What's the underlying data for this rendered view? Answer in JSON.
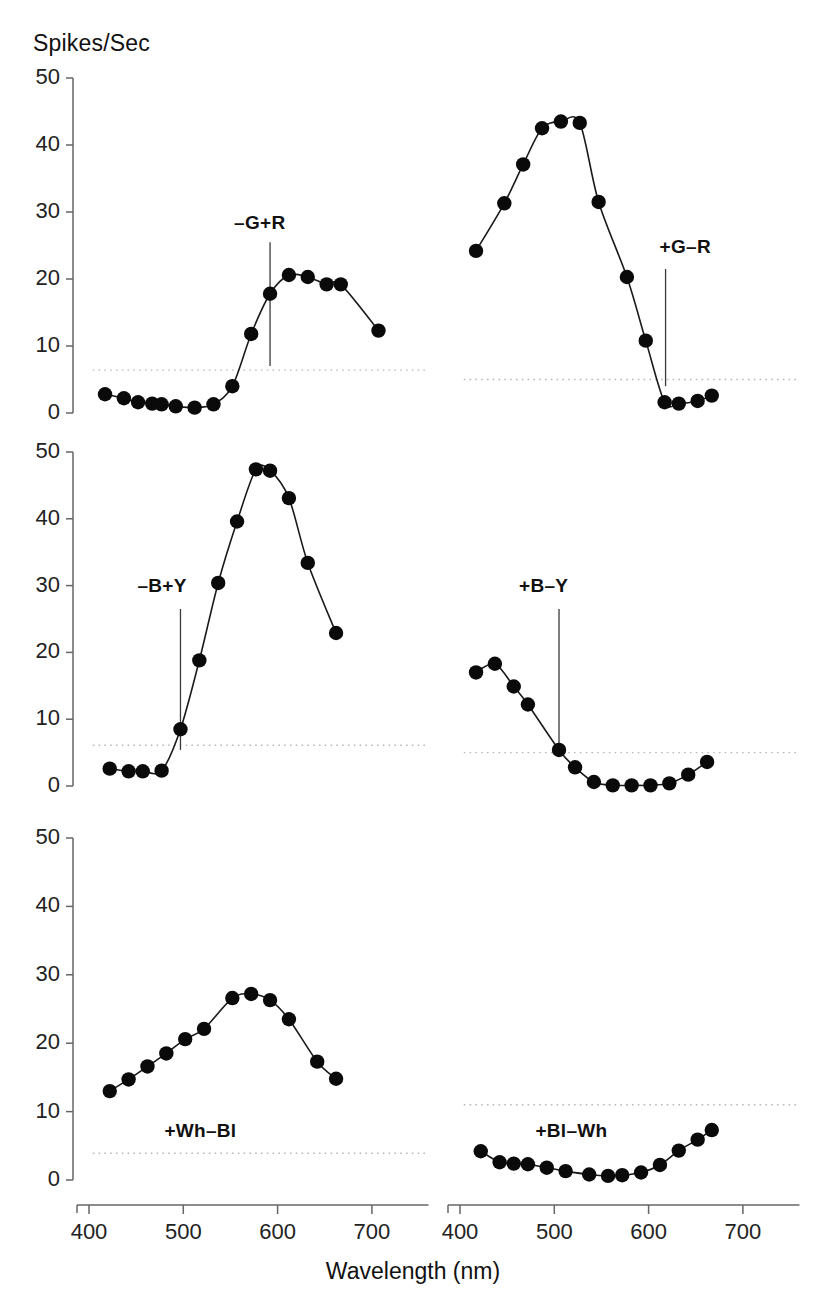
{
  "figure": {
    "y_axis_title": "Spikes/Sec",
    "x_axis_title": "Wavelength (nm)",
    "y_ticks": [
      "0",
      "10",
      "20",
      "30",
      "40",
      "50"
    ],
    "x_ticks": [
      "400",
      "500",
      "600",
      "700"
    ]
  },
  "chart_data": {
    "type": "line",
    "title": "Spikes/Sec",
    "xlabel": "Wavelength (nm)",
    "ylabel": "Spikes/Sec",
    "xlim": [
      400,
      760
    ],
    "ylim": [
      0,
      50
    ],
    "grid": false,
    "legend": "none",
    "layout": "3 rows x 2 columns of panels, shared axes",
    "panels": [
      {
        "id": "panel-g-plus-r",
        "row": 1,
        "col": 1,
        "annotation": "–G+R",
        "annotation_wavelength": 592,
        "baseline_rate": 6.4,
        "x": [
          417,
          437,
          452,
          467,
          477,
          492,
          512,
          532,
          552,
          572,
          592,
          612,
          632,
          652,
          667,
          707
        ],
        "y": [
          2.8,
          2.2,
          1.6,
          1.4,
          1.3,
          1.0,
          0.8,
          1.3,
          4.0,
          11.8,
          17.8,
          20.6,
          20.3,
          19.2,
          19.2,
          12.3
        ],
        "series_name": "–G+R"
      },
      {
        "id": "panel-plus-g-minus-r",
        "row": 1,
        "col": 2,
        "annotation": "+G–R",
        "annotation_wavelength": 618,
        "baseline_rate": 5.0,
        "x": [
          417,
          447,
          467,
          487,
          507,
          527,
          547,
          577,
          597,
          617,
          632,
          652,
          667
        ],
        "y": [
          24.2,
          31.3,
          37.1,
          42.5,
          43.5,
          43.3,
          31.5,
          20.3,
          10.8,
          1.6,
          1.4,
          1.8,
          2.6
        ],
        "series_name": "+G–R"
      },
      {
        "id": "panel-minus-b-plus-y",
        "row": 2,
        "col": 1,
        "annotation": "–B+Y",
        "annotation_wavelength": 497,
        "baseline_rate": 6.1,
        "x": [
          422,
          442,
          457,
          477,
          497,
          517,
          537,
          557,
          577,
          592,
          612,
          632,
          662
        ],
        "y": [
          2.6,
          2.2,
          2.2,
          2.3,
          8.5,
          18.8,
          30.4,
          39.6,
          47.4,
          47.2,
          43.1,
          33.4,
          22.9
        ],
        "series_name": "–B+Y"
      },
      {
        "id": "panel-plus-b-minus-y",
        "row": 2,
        "col": 2,
        "annotation": "+B–Y",
        "annotation_wavelength": 505,
        "baseline_rate": 5.0,
        "x": [
          417,
          437,
          457,
          472,
          505,
          522,
          542,
          562,
          582,
          602,
          622,
          642,
          662
        ],
        "y": [
          17.0,
          18.3,
          14.9,
          12.2,
          5.4,
          2.8,
          0.6,
          0.1,
          0.1,
          0.1,
          0.4,
          1.7,
          3.6
        ],
        "series_name": "+B–Y"
      },
      {
        "id": "panel-plus-wh-minus-bl",
        "row": 3,
        "col": 1,
        "annotation": "+Wh–Bl",
        "annotation_wavelength": null,
        "baseline_rate": 3.9,
        "x": [
          422,
          442,
          462,
          482,
          502,
          522,
          552,
          572,
          592,
          612,
          642,
          662
        ],
        "y": [
          13.0,
          14.7,
          16.6,
          18.5,
          20.6,
          22.1,
          26.6,
          27.2,
          26.3,
          23.5,
          17.3,
          14.8
        ],
        "series_name": "+Wh–Bl"
      },
      {
        "id": "panel-plus-bl-minus-wh",
        "row": 3,
        "col": 2,
        "annotation": "+Bl–Wh",
        "annotation_wavelength": null,
        "baseline_rate": 11.0,
        "x": [
          422,
          442,
          457,
          472,
          492,
          512,
          537,
          557,
          572,
          592,
          612,
          632,
          652,
          667
        ],
        "y": [
          4.2,
          2.6,
          2.4,
          2.3,
          1.8,
          1.3,
          0.8,
          0.6,
          0.7,
          1.1,
          2.2,
          4.3,
          5.9,
          7.3
        ],
        "series_name": "+Bl–Wh"
      }
    ]
  }
}
